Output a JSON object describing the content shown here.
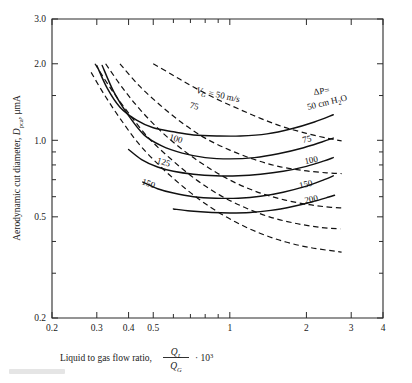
{
  "figure": {
    "type": "line-chart-log-log",
    "background": "#ffffff",
    "ink_color": "#111111"
  },
  "axes": {
    "x": {
      "label_prefix": "Liquid to gas flow ratio,",
      "label_numerator": "Q",
      "label_numerator_sub": "L",
      "label_denominator": "Q",
      "label_denominator_sub": "G",
      "label_dot": "·",
      "label_factor_base": "10",
      "label_factor_exp": "3",
      "scale": "log",
      "min": 0.2,
      "max": 4,
      "tick_labels": [
        "0.2",
        "0.3",
        "0.4",
        "0.5",
        "1",
        "2",
        "3",
        "4"
      ],
      "tick_values": [
        0.2,
        0.3,
        0.4,
        0.5,
        1,
        2,
        3,
        4
      ],
      "minor_ticks": [
        0.6,
        0.7,
        0.8,
        0.9
      ]
    },
    "y": {
      "label_prefix": "Aerodynamic cut diameter,",
      "label_symbol": "D",
      "label_symbol_sub": "pca",
      "label_units": ", μmA",
      "scale": "log",
      "min": 0.2,
      "max": 3.0,
      "tick_labels": [
        "3.0",
        "2.0",
        "1.0",
        "0.5",
        "0.2"
      ],
      "tick_values": [
        3.0,
        2.0,
        1.0,
        0.5,
        0.2
      ],
      "minor_ticks": [
        0.3,
        0.4,
        0.6,
        0.7,
        0.8,
        0.9,
        1.5
      ]
    }
  },
  "series_groups": {
    "pressure_drop": {
      "style": "solid",
      "legend_title_symbol": "ΔP",
      "legend_title_eq": "=",
      "legend_unit": "50 cm H",
      "legend_unit_sub": "2",
      "legend_unit_tail": "O",
      "labels": [
        "50 cm H2O",
        "75",
        "100",
        "150",
        "200"
      ],
      "label_texts": [
        "75",
        "100",
        "150",
        "200"
      ]
    },
    "gas_velocity": {
      "style": "dashed",
      "legend_title_symbol": "V",
      "legend_title_sub": "G",
      "legend_title_eq": "= 50 m/s",
      "labels": [
        "50",
        "75",
        "100",
        "125",
        "150"
      ],
      "label_texts": [
        "75",
        "100",
        "125",
        "150"
      ]
    }
  },
  "chart_data": {
    "type": "line",
    "title": "",
    "xlabel": "Liquid to gas flow ratio, Q_L/Q_G · 10^3",
    "ylabel": "Aerodynamic cut diameter, D_pca, μmA",
    "xscale": "log",
    "yscale": "log",
    "xlim": [
      0.2,
      4
    ],
    "ylim": [
      0.2,
      3.0
    ],
    "xticks": [
      0.2,
      0.3,
      0.4,
      0.5,
      1,
      2,
      3,
      4
    ],
    "yticks": [
      0.2,
      0.5,
      1.0,
      2.0,
      3.0
    ],
    "grid": false,
    "legend": "inline-curve-labels",
    "series": [
      {
        "name": "ΔP = 50 cm H2O",
        "group": "pressure_drop",
        "style": "solid",
        "label": "50 cm H2O",
        "x": [
          0.3,
          0.33,
          0.37,
          0.43,
          0.5,
          0.6,
          0.72,
          0.9,
          1.1,
          1.4,
          1.75,
          2.15,
          2.55
        ],
        "y": [
          1.97,
          1.6,
          1.35,
          1.2,
          1.12,
          1.08,
          1.05,
          1.04,
          1.04,
          1.06,
          1.11,
          1.18,
          1.26
        ]
      },
      {
        "name": "ΔP = 75",
        "group": "pressure_drop",
        "style": "solid",
        "label": "75",
        "x": [
          0.315,
          0.35,
          0.4,
          0.46,
          0.54,
          0.65,
          0.8,
          1.0,
          1.25,
          1.55,
          1.95,
          2.3,
          2.55
        ],
        "y": [
          1.97,
          1.55,
          1.25,
          1.05,
          0.95,
          0.89,
          0.855,
          0.845,
          0.855,
          0.885,
          0.935,
          0.985,
          1.02
        ]
      },
      {
        "name": "ΔP = 100",
        "group": "pressure_drop",
        "style": "solid",
        "label": "100",
        "x": [
          0.4,
          0.45,
          0.52,
          0.6,
          0.72,
          0.88,
          1.08,
          1.32,
          1.62,
          2.0,
          2.35,
          2.55
        ],
        "y": [
          0.92,
          0.84,
          0.785,
          0.755,
          0.735,
          0.725,
          0.725,
          0.735,
          0.755,
          0.79,
          0.83,
          0.855
        ]
      },
      {
        "name": "ΔP = 150",
        "group": "pressure_drop",
        "style": "solid",
        "label": "150",
        "x": [
          0.455,
          0.52,
          0.6,
          0.72,
          0.88,
          1.08,
          1.32,
          1.62,
          2.0,
          2.35,
          2.55
        ],
        "y": [
          0.685,
          0.645,
          0.62,
          0.6,
          0.592,
          0.592,
          0.602,
          0.625,
          0.66,
          0.7,
          0.725
        ]
      },
      {
        "name": "ΔP = 200",
        "group": "pressure_drop",
        "style": "solid",
        "label": "200",
        "x": [
          0.6,
          0.7,
          0.85,
          1.0,
          1.2,
          1.45,
          1.75,
          2.1,
          2.45,
          2.58
        ],
        "y": [
          0.537,
          0.527,
          0.52,
          0.518,
          0.52,
          0.53,
          0.548,
          0.572,
          0.598,
          0.608
        ]
      },
      {
        "name": "V_G = 50 m/s",
        "group": "gas_velocity",
        "style": "dashed",
        "label": "50",
        "x": [
          0.5,
          0.6,
          0.72,
          0.88,
          1.08,
          1.32,
          1.62,
          2.0,
          2.4,
          2.75
        ],
        "y": [
          2.0,
          1.8,
          1.62,
          1.46,
          1.33,
          1.22,
          1.13,
          1.065,
          1.02,
          0.995
        ]
      },
      {
        "name": "V_G = 75",
        "group": "gas_velocity",
        "style": "dashed",
        "label": "75",
        "x": [
          0.37,
          0.44,
          0.53,
          0.65,
          0.8,
          1.0,
          1.25,
          1.55,
          1.95,
          2.4,
          2.75
        ],
        "y": [
          2.0,
          1.64,
          1.38,
          1.17,
          1.02,
          0.915,
          0.84,
          0.79,
          0.76,
          0.745,
          0.74
        ]
      },
      {
        "name": "V_G = 100",
        "group": "gas_velocity",
        "style": "dashed",
        "label": "100",
        "x": [
          0.325,
          0.38,
          0.45,
          0.55,
          0.68,
          0.85,
          1.06,
          1.32,
          1.65,
          2.05,
          2.5,
          2.75
        ],
        "y": [
          2.0,
          1.6,
          1.3,
          1.06,
          0.89,
          0.765,
          0.678,
          0.62,
          0.582,
          0.558,
          0.545,
          0.542
        ]
      },
      {
        "name": "V_G = 125",
        "group": "gas_velocity",
        "style": "dashed",
        "label": "125",
        "x": [
          0.295,
          0.34,
          0.4,
          0.48,
          0.59,
          0.73,
          0.91,
          1.14,
          1.43,
          1.8,
          2.25,
          2.72
        ],
        "y": [
          2.0,
          1.6,
          1.28,
          1.02,
          0.84,
          0.705,
          0.61,
          0.545,
          0.5,
          0.472,
          0.455,
          0.448
        ]
      },
      {
        "name": "V_G = 150",
        "group": "gas_velocity",
        "style": "dashed",
        "label": "150",
        "x": [
          0.285,
          0.32,
          0.37,
          0.44,
          0.54,
          0.67,
          0.84,
          1.05,
          1.32,
          1.66,
          2.08,
          2.6,
          2.75
        ],
        "y": [
          1.85,
          1.52,
          1.22,
          0.965,
          0.78,
          0.645,
          0.545,
          0.478,
          0.43,
          0.398,
          0.378,
          0.366,
          0.363
        ]
      }
    ]
  }
}
